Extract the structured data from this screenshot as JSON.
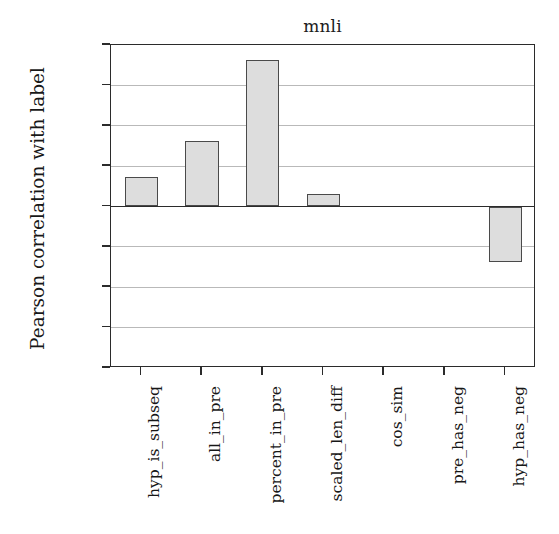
{
  "chart_data": {
    "type": "bar",
    "title": "mnli",
    "xlabel": "",
    "ylabel": "Pearson correlation with label",
    "categories": [
      "hyp_is_subseq",
      "all_in_pre",
      "percent_in_pre",
      "scaled_len_diff",
      "cos_sim",
      "pre_has_neg",
      "hyp_has_neg"
    ],
    "values": [
      0.073,
      0.163,
      0.362,
      0.032,
      0.0,
      0.0,
      -0.137
    ],
    "ylim": [
      -0.4,
      0.4
    ],
    "ytick_labels": [
      "0.4",
      "0.3",
      "0.2",
      "0.1",
      "0.0",
      "−0.1",
      "−0.2",
      "−0.3",
      "−0.4"
    ],
    "ytick_values": [
      0.4,
      0.3,
      0.2,
      0.1,
      0.0,
      -0.1,
      -0.2,
      -0.3,
      -0.4
    ],
    "grid": true,
    "legend": false,
    "bar_fill_color": "#dddddd",
    "bar_edge_color": "#4a4a4a",
    "axis_color": "#2b2b2b",
    "grid_color": "#b9b9b9",
    "background_color": "#ffffff"
  }
}
